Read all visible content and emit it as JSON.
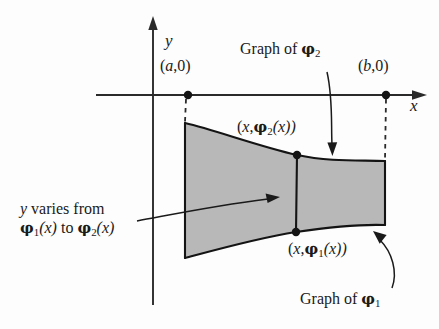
{
  "figure": {
    "type": "mathematical-diagram",
    "background_color": "#fdfdfd",
    "ink_color": "#1a1a1a",
    "fill_color": "#b8b8b8"
  },
  "axes": {
    "y_axis_label": "y",
    "x_axis_label": "x"
  },
  "labels": {
    "point_a": "(a,0)",
    "point_b": "(b,0)",
    "upper_point": "(x,φ₂(x))",
    "lower_point": "(x,φ₁(x))",
    "graph_of_phi2": "Graph of φ₂",
    "graph_of_phi1": "Graph of φ₁",
    "varies_line1": "y varies from",
    "varies_line2": "φ₁(x) to φ₂(x)"
  },
  "label_parts": {
    "point_a": {
      "open": "(",
      "var": "a",
      "rest": ",0)"
    },
    "point_b": {
      "open": "(",
      "var": "b",
      "rest": ",0)"
    },
    "upper_point": {
      "open": "(",
      "var": "x",
      "comma": ",",
      "phi": "φ",
      "sub": "2",
      "arg": "(x))"
    },
    "lower_point": {
      "open": "(",
      "var": "x",
      "comma": ",",
      "phi": "φ",
      "sub": "1",
      "arg": "(x))"
    },
    "graph_of": "Graph of ",
    "phi_glyph": "φ",
    "sub_one": "1",
    "sub_two": "2",
    "varies_y": "y",
    "varies_text": " varies from",
    "varies_to": " to "
  },
  "geometry": {
    "y_axis": {
      "x": 153,
      "top": 18,
      "bottom": 305
    },
    "x_axis": {
      "y": 95,
      "left": 95,
      "right": 425
    },
    "point_a_dot": {
      "x": 188,
      "y": 95
    },
    "point_b_dot": {
      "x": 386,
      "y": 95
    },
    "upper_dot": {
      "x": 297,
      "y": 155
    },
    "lower_dot": {
      "x": 296,
      "y": 232
    },
    "region_left_x": 185,
    "region_right_x": 385
  }
}
